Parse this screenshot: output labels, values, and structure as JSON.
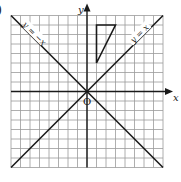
{
  "figure": {
    "part_label": ")",
    "grid": {
      "cells_x": 16,
      "cells_y": 16,
      "x_min": -8,
      "x_max": 8,
      "y_min": -8,
      "y_max": 8,
      "origin_px": [
        87,
        91.5
      ],
      "unit_px": 9.5,
      "grid_color": "#9a9a9a",
      "ink_color": "#1a1a1a"
    },
    "axes": {
      "x_label": "x",
      "y_label": "y",
      "origin_label": "O"
    },
    "lines": [
      {
        "name": "line-y-equals-x",
        "label": "y = x",
        "slope": 1
      },
      {
        "name": "line-y-equals-neg-x",
        "label": "y = −x",
        "slope": -1
      }
    ],
    "triangle": {
      "vertices": [
        [
          1,
          7
        ],
        [
          3,
          7
        ],
        [
          1,
          3
        ]
      ]
    }
  }
}
